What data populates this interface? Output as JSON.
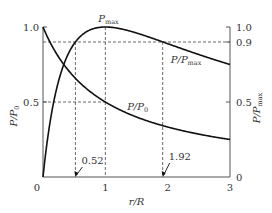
{
  "chart_data": {
    "type": "line",
    "title": "",
    "xlabel": "r/R",
    "ylabel_left": "P/P0",
    "ylabel_right": "P/Pmax",
    "xlim": [
      0,
      3
    ],
    "ylim_left": [
      0,
      1.0
    ],
    "ylim_right": [
      0,
      1.0
    ],
    "x_ticks": [
      "0",
      "1",
      "2",
      "3"
    ],
    "x_tick_values": [
      0,
      1,
      2,
      3
    ],
    "y_left_ticks": [
      "0.5",
      "1.0"
    ],
    "y_left_tick_values": [
      0.5,
      1.0
    ],
    "y_right_ticks": [
      "0",
      "0.5",
      "0.9",
      "1.0"
    ],
    "y_right_tick_values": [
      0,
      0.5,
      0.9,
      1.0
    ],
    "grid": false,
    "series": [
      {
        "name": "P/P0",
        "formula": "1/(1+x)",
        "x": [
          0,
          0.25,
          0.5,
          0.75,
          1,
          1.5,
          2,
          2.5,
          3
        ],
        "values": [
          1.0,
          0.8,
          0.667,
          0.571,
          0.5,
          0.4,
          0.333,
          0.286,
          0.25
        ]
      },
      {
        "name": "P/Pmax",
        "formula": "4x/(1+x)^2",
        "x": [
          0,
          0.1,
          0.25,
          0.52,
          0.75,
          1,
          1.5,
          1.92,
          2.5,
          3
        ],
        "values": [
          0,
          0.331,
          0.64,
          0.9,
          0.98,
          1.0,
          0.96,
          0.9,
          0.816,
          0.75
        ]
      }
    ],
    "annotations": {
      "peak_label": "Pmax",
      "peak_x": 1,
      "peak_y": 1.0,
      "series_label_p0": "P/P0",
      "series_label_pmax": "P/Pmax",
      "marker_low": {
        "label": "0.52",
        "x": 0.52,
        "y": 0.9
      },
      "marker_high": {
        "label": "1.92",
        "x": 1.92,
        "y": 0.9
      },
      "guide_p0_half": {
        "x": 1,
        "y": 0.5
      }
    }
  }
}
